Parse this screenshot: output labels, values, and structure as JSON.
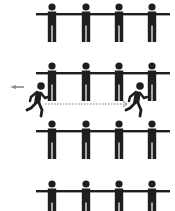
{
  "diagram": {
    "title": "",
    "colors": {
      "figure": "#1e1e1e",
      "arrow": "#777777",
      "background": "#ffffff"
    },
    "rows": [
      {
        "id": "row-1",
        "y": 0,
        "figures": 4
      },
      {
        "id": "row-2",
        "y": 59,
        "figures": 4
      },
      {
        "id": "row-3",
        "y": 117,
        "figures": 4
      },
      {
        "id": "row-4",
        "y": 177,
        "figures": 4
      }
    ],
    "figure_x": [
      52,
      86,
      119,
      152
    ],
    "runners": [
      {
        "id": "runner-start",
        "x": 38,
        "y": 100,
        "label": ""
      },
      {
        "id": "runner-end",
        "x": 137,
        "y": 100,
        "label": ""
      }
    ],
    "path": {
      "from": [
        45,
        104
      ],
      "to": [
        127,
        104
      ],
      "style": "dotted-arrow"
    },
    "motion_mark": {
      "x": 15,
      "y": 87,
      "icon": "speed-lines-icon"
    }
  }
}
